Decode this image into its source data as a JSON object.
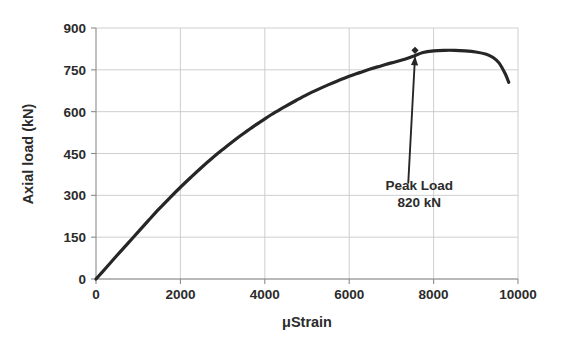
{
  "chart_data": {
    "type": "line",
    "title": "",
    "xlabel": "μStrain",
    "ylabel": "Axial load (kN)",
    "xlim": [
      0,
      10000
    ],
    "ylim": [
      0,
      900
    ],
    "xticks": [
      0,
      2000,
      4000,
      6000,
      8000,
      10000
    ],
    "xtick_labels": [
      "0",
      "2000",
      "4000",
      "6000",
      "8000",
      "10000"
    ],
    "yticks": [
      0,
      150,
      300,
      450,
      600,
      750,
      900
    ],
    "ytick_labels": [
      "0",
      "150",
      "300",
      "450",
      "600",
      "750",
      "900"
    ],
    "grid": true,
    "legend": null,
    "series": [
      {
        "name": "Axial load vs strain",
        "color": "#262626",
        "x": [
          0,
          250,
          500,
          750,
          1000,
          1250,
          1500,
          1750,
          2000,
          2250,
          2500,
          2750,
          3000,
          3250,
          3500,
          3750,
          4000,
          4250,
          4500,
          4750,
          5000,
          5250,
          5500,
          5750,
          6000,
          6250,
          6500,
          6750,
          7000,
          7250,
          7500,
          7750,
          8000,
          8250,
          8500,
          8750,
          9000,
          9250,
          9400,
          9550,
          9700,
          9780
        ],
        "y": [
          0,
          42,
          85,
          127,
          169,
          211,
          252,
          291,
          329,
          365,
          400,
          433,
          464,
          494,
          522,
          549,
          574,
          598,
          620,
          641,
          661,
          679,
          696,
          712,
          727,
          740,
          753,
          764,
          775,
          785,
          798,
          812,
          818,
          820,
          820,
          818,
          814,
          806,
          795,
          775,
          735,
          705
        ]
      }
    ],
    "annotations": [
      {
        "name": "peak-load",
        "label_line1": "Peak Load",
        "label_line2": "820 kN",
        "point_x": 7560,
        "point_y": 820,
        "text_x": 7400,
        "text_y": 345,
        "arrow": true
      }
    ],
    "markers": [
      {
        "name": "peak-marker",
        "x": 7560,
        "y": 820,
        "shape": "diamond"
      }
    ]
  },
  "axes": {
    "y_title": "Axial load (kN)",
    "x_title": "μStrain"
  },
  "colors": {
    "curve": "#262626",
    "grid": "#c9c9c9",
    "axis": "#8c8c8c",
    "text": "#2b2b2b",
    "background": "#ffffff"
  }
}
